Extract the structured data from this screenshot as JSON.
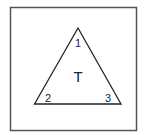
{
  "diagram": {
    "frame": {
      "x": 10,
      "y": 7,
      "width": 126,
      "height": 123,
      "stroke": "#555555"
    },
    "triangle": {
      "label": "T",
      "vertices": [
        {
          "id": "1",
          "x": 78,
          "y": 28
        },
        {
          "id": "2",
          "x": 34,
          "y": 104
        },
        {
          "id": "3",
          "x": 121,
          "y": 104
        }
      ],
      "stroke": "#222222"
    },
    "labels": {
      "center": "T",
      "vertex1": "1",
      "vertex2": "2",
      "vertex3": "3"
    }
  }
}
